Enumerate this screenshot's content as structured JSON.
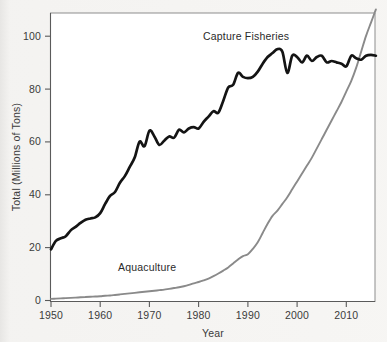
{
  "chart_data": {
    "type": "line",
    "title": "",
    "xlabel": "Year",
    "ylabel": "Total (Millions of Tons)",
    "xlim": [
      1950,
      2016
    ],
    "ylim": [
      0,
      110
    ],
    "xticks": [
      1950,
      1960,
      1970,
      1980,
      1990,
      2000,
      2010
    ],
    "xtick_labels": [
      "1950",
      "1960",
      "1970",
      "1980",
      "1990",
      "2000",
      "2010"
    ],
    "yticks": [
      0,
      20,
      40,
      60,
      80,
      100
    ],
    "ytick_labels": [
      "0",
      "20",
      "40",
      "60",
      "80",
      "100"
    ],
    "grid": false,
    "legend_position": "inline-annotations",
    "colors": {
      "capture_fisheries": "#141414",
      "aquaculture": "#8a8a8a",
      "axis": "#5a5a5a",
      "frame": "#8d8d8d",
      "plot_background": "#ffffff",
      "figure_background": "#f4f3f1"
    },
    "annotations": [
      {
        "text": "Capture Fisheries",
        "x": 1986,
        "y": 101
      },
      {
        "text": "Aquaculture",
        "x": 1976,
        "y": 9
      }
    ],
    "x": [
      1950,
      1951,
      1952,
      1953,
      1954,
      1955,
      1956,
      1957,
      1958,
      1959,
      1960,
      1961,
      1962,
      1963,
      1964,
      1965,
      1966,
      1967,
      1968,
      1969,
      1970,
      1971,
      1972,
      1973,
      1974,
      1975,
      1976,
      1977,
      1978,
      1979,
      1980,
      1981,
      1982,
      1983,
      1984,
      1985,
      1986,
      1987,
      1988,
      1989,
      1990,
      1991,
      1992,
      1993,
      1994,
      1995,
      1996,
      1997,
      1998,
      1999,
      2000,
      2001,
      2002,
      2003,
      2004,
      2005,
      2006,
      2007,
      2008,
      2009,
      2010,
      2011,
      2012,
      2013,
      2014,
      2015,
      2016
    ],
    "series": [
      {
        "name": "Capture Fisheries",
        "color": "#141414",
        "values": [
          19.3,
          22.5,
          23.5,
          24.3,
          26.5,
          27.8,
          29.3,
          30.5,
          31.0,
          31.4,
          33.0,
          36.5,
          39.5,
          41.0,
          44.5,
          47.0,
          50.5,
          54.0,
          60.0,
          58.3,
          64.2,
          62.0,
          58.8,
          60.4,
          62.0,
          61.5,
          64.5,
          63.5,
          65.0,
          65.5,
          65.0,
          67.5,
          69.5,
          71.5,
          71.0,
          75.5,
          80.5,
          81.5,
          86.0,
          84.5,
          84.0,
          84.5,
          86.5,
          89.5,
          92.0,
          93.5,
          95.0,
          94.0,
          86.0,
          92.5,
          92.0,
          90.0,
          92.5,
          90.5,
          92.0,
          92.5,
          90.0,
          90.5,
          90.0,
          89.5,
          88.5,
          92.5,
          91.5,
          91.0,
          92.5,
          92.8,
          92.5
        ]
      },
      {
        "name": "Aquaculture",
        "color": "#8a8a8a",
        "values": [
          0.6,
          0.7,
          0.8,
          0.9,
          1.0,
          1.1,
          1.2,
          1.3,
          1.4,
          1.5,
          1.6,
          1.8,
          1.9,
          2.1,
          2.3,
          2.5,
          2.7,
          2.9,
          3.1,
          3.3,
          3.5,
          3.7,
          3.9,
          4.1,
          4.4,
          4.7,
          5.0,
          5.4,
          5.9,
          6.5,
          7.0,
          7.6,
          8.3,
          9.2,
          10.2,
          11.3,
          12.5,
          14.0,
          15.5,
          16.8,
          17.5,
          19.5,
          22.0,
          25.5,
          29.0,
          32.0,
          34.0,
          36.5,
          39.0,
          42.0,
          45.0,
          48.0,
          51.0,
          54.0,
          57.5,
          61.0,
          64.5,
          68.0,
          71.5,
          75.0,
          79.0,
          83.0,
          88.0,
          94.0,
          100.0,
          105.0,
          110.0
        ]
      }
    ]
  }
}
